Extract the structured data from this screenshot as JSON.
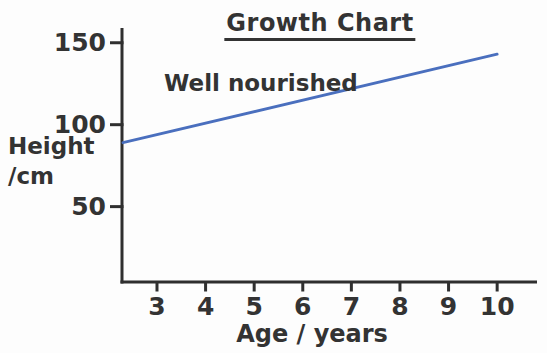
{
  "colors": {
    "line": "#4a6fbe",
    "axis": "#2f2f2f",
    "text": "#333333",
    "background": "#fdfdfd"
  },
  "chart_data": {
    "type": "line",
    "title": "Growth Chart",
    "xlabel": "Age / years",
    "ylabel": "Height /cm",
    "ylabel_lines": [
      "Height",
      "/cm"
    ],
    "x_ticks": [
      3,
      4,
      5,
      6,
      7,
      8,
      9,
      10
    ],
    "y_ticks": [
      50,
      100,
      150
    ],
    "xlim": [
      2.28,
      10.82
    ],
    "ylim": [
      4,
      159
    ],
    "grid": false,
    "legend_position": "inline-label-above-line",
    "series": [
      {
        "name": "Well nourished",
        "color": "#4a6fbe",
        "points": [
          {
            "x": 2.3,
            "y": 89
          },
          {
            "x": 10,
            "y": 143
          }
        ],
        "values_by_age": {
          "3": 94,
          "4": 101,
          "5": 108,
          "6": 115,
          "7": 122,
          "8": 129,
          "9": 136,
          "10": 143
        }
      }
    ]
  }
}
